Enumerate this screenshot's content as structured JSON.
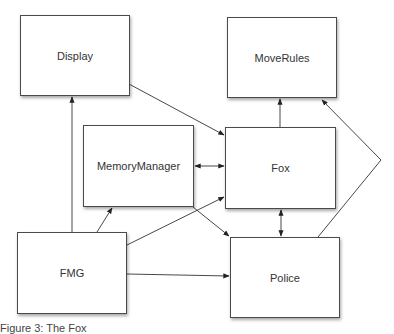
{
  "diagram": {
    "nodes": [
      {
        "id": "display",
        "label": "Display",
        "x": 20,
        "y": 15,
        "w": 110,
        "h": 81
      },
      {
        "id": "moverules",
        "label": "MoveRules",
        "x": 227,
        "y": 17,
        "w": 110,
        "h": 81
      },
      {
        "id": "memorymanager",
        "label": "MemoryManager",
        "x": 83,
        "y": 125,
        "w": 111,
        "h": 82
      },
      {
        "id": "fox",
        "label": "Fox",
        "x": 225,
        "y": 127,
        "w": 111,
        "h": 82
      },
      {
        "id": "fmg",
        "label": "FMG",
        "x": 17,
        "y": 232,
        "w": 110,
        "h": 82
      },
      {
        "id": "police",
        "label": "Police",
        "x": 230,
        "y": 237,
        "w": 110,
        "h": 81
      }
    ],
    "edges": [
      {
        "from": "display",
        "to": "fox",
        "direction": "forward"
      },
      {
        "from": "fmg",
        "to": "display",
        "direction": "forward"
      },
      {
        "from": "fox",
        "to": "moverules",
        "direction": "forward"
      },
      {
        "from": "memorymanager",
        "to": "fox",
        "direction": "both"
      },
      {
        "from": "fmg",
        "to": "memorymanager",
        "direction": "forward"
      },
      {
        "from": "fmg",
        "to": "fox",
        "direction": "forward"
      },
      {
        "from": "memorymanager",
        "to": "police",
        "direction": "forward"
      },
      {
        "from": "fmg",
        "to": "police",
        "direction": "forward"
      },
      {
        "from": "fox",
        "to": "police",
        "direction": "both"
      },
      {
        "from": "police",
        "to": "moverules",
        "direction": "forward"
      }
    ],
    "caption": "Figure 3: The Fox"
  }
}
